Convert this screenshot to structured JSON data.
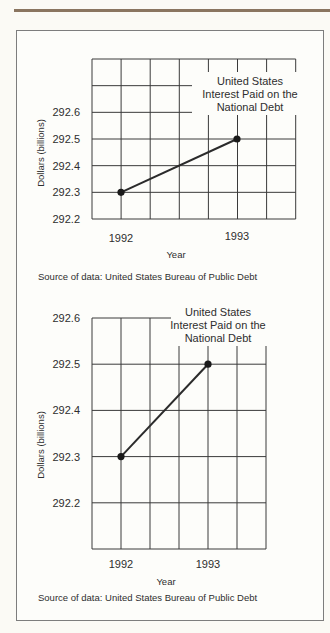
{
  "chart_data": [
    {
      "type": "line",
      "title": "United States Interest Paid on the National Debt",
      "title_lines": [
        "United States",
        "Interest Paid on the",
        "National Debt"
      ],
      "xlabel": "Year",
      "ylabel": "Dollars (billions)",
      "categories": [
        "1992",
        "1993"
      ],
      "series": [
        {
          "name": "Interest Paid",
          "values": [
            292.3,
            292.5
          ]
        }
      ],
      "yticks": [
        292.2,
        292.3,
        292.4,
        292.5,
        292.6
      ],
      "ylim": [
        292.2,
        292.8
      ],
      "grid": true,
      "source": "Source of data: United States Bureau of Public Debt"
    },
    {
      "type": "line",
      "title": "United States Interest Paid on the National Debt",
      "title_lines": [
        "United States",
        "Interest Paid on the",
        "National Debt"
      ],
      "xlabel": "Year",
      "ylabel": "Dollars (billions)",
      "categories": [
        "1992",
        "1993"
      ],
      "series": [
        {
          "name": "Interest Paid",
          "values": [
            292.3,
            292.5
          ]
        }
      ],
      "yticks": [
        292.2,
        292.3,
        292.4,
        292.5,
        292.6
      ],
      "ylim": [
        292.1,
        292.6
      ],
      "grid": true,
      "source": "Source of data: United States Bureau of Public Debt"
    }
  ],
  "colors": {
    "line": "#2b2b2b",
    "grid": "#3a3a3a",
    "frame": "#7d7d7d",
    "rule": "#8a7560"
  }
}
